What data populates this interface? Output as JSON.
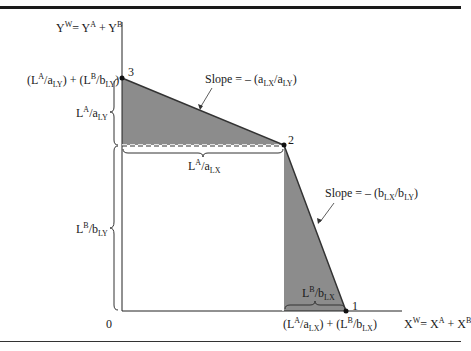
{
  "figure": {
    "y_axis_label": {
      "main": "Y",
      "sup_w": "W",
      "eq": "= Y",
      "sup_a": "A",
      "plus": " + Y",
      "sup_b": "B"
    },
    "x_axis_label": {
      "main": "X",
      "sup_w": "W",
      "eq": "= X",
      "sup_a": "A",
      "plus": " + X",
      "sup_b": "B"
    },
    "origin_label": "0",
    "points": [
      {
        "id": "1",
        "label": "1",
        "x": 346,
        "y": 311
      },
      {
        "id": "2",
        "label": "2",
        "x": 284,
        "y": 145
      },
      {
        "id": "3",
        "label": "3",
        "x": 122,
        "y": 78
      }
    ],
    "y_intercept_label": "(L^A/a_LY) + (L^B/b_LY)",
    "x_intercept_label": "(L^A/a_LX) + (L^B/b_LX)",
    "brace_labels": {
      "la_aly": "L^A/a_LY",
      "lb_bly": "L^B/b_LY",
      "la_alx": "L^A/a_LX",
      "lb_blx": "L^B/b_LX"
    },
    "slope_upper": "Slope = – (a_LX/a_LY)",
    "slope_lower": "Slope = – (b_LX/b_LY)",
    "colors": {
      "fill": "#8c8c8c",
      "line": "#222222",
      "background": "#ffffff"
    }
  }
}
